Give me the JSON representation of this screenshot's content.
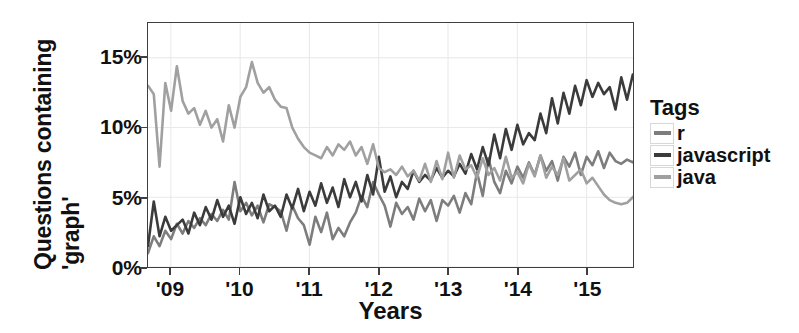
{
  "chart_data": {
    "type": "line",
    "title": "",
    "xlabel": "Years",
    "ylabel": "Questions containing 'graph'",
    "ylabel_lines": [
      "Questions containing",
      "'graph'"
    ],
    "xlim": [
      2008.67,
      2015.67
    ],
    "ylim": [
      0,
      17.5
    ],
    "yticks": [
      0,
      5,
      10,
      15
    ],
    "ytick_labels": [
      "0%",
      "5%",
      "10%",
      "15%"
    ],
    "xticks": [
      2009,
      2010,
      2011,
      2012,
      2013,
      2014,
      2015
    ],
    "xtick_labels": [
      "'09",
      "'10",
      "'11",
      "'12",
      "'13",
      "'14",
      "'15"
    ],
    "grid": true,
    "legend_position": "right",
    "legend_title": "Tags",
    "units": "percent",
    "x_start": 2008.67,
    "x_step": 0.0833,
    "series": [
      {
        "name": "r",
        "color": "#7d7d7d",
        "values": [
          1.0,
          2.2,
          1.5,
          2.6,
          2.0,
          3.1,
          2.4,
          3.3,
          2.8,
          3.5,
          3.0,
          3.8,
          3.3,
          4.1,
          3.4,
          6.1,
          4.0,
          4.6,
          3.7,
          4.4,
          3.2,
          4.5,
          4.3,
          4.0,
          2.6,
          4.4,
          3.5,
          3.0,
          1.6,
          3.6,
          2.5,
          3.9,
          2.0,
          2.8,
          2.2,
          3.2,
          3.9,
          5.1,
          4.3,
          6.1,
          5.2,
          4.4,
          2.9,
          4.6,
          3.8,
          4.3,
          3.4,
          4.9,
          4.0,
          4.8,
          3.3,
          4.8,
          4.4,
          5.1,
          3.9,
          5.3,
          4.5,
          6.8,
          5.1,
          7.8,
          6.1,
          5.3,
          6.9,
          6.0,
          7.2,
          6.4,
          7.5,
          6.6,
          8.0,
          6.9,
          7.6,
          6.2,
          7.9,
          7.2,
          8.2,
          6.6,
          7.9,
          7.3,
          8.3,
          7.1,
          8.2,
          7.6,
          7.4,
          7.7,
          7.5,
          8.0,
          7.8,
          7.6,
          8.1,
          8.6,
          7.9,
          9.0,
          8.2,
          9.4,
          8.6,
          9.7
        ]
      },
      {
        "name": "javascript",
        "color": "#3b3b3b",
        "values": [
          1.5,
          4.7,
          2.2,
          3.6,
          2.6,
          3.0,
          3.4,
          2.4,
          3.9,
          3.0,
          4.3,
          3.4,
          4.8,
          3.6,
          4.4,
          3.1,
          5.0,
          3.8,
          4.6,
          3.5,
          5.2,
          4.0,
          4.4,
          3.6,
          5.2,
          4.2,
          5.6,
          4.0,
          5.4,
          4.4,
          6.0,
          4.6,
          5.7,
          4.3,
          6.3,
          5.0,
          6.1,
          4.7,
          6.6,
          5.2,
          7.9,
          5.4,
          6.5,
          5.0,
          6.1,
          5.6,
          6.9,
          6.1,
          6.6,
          6.2,
          7.1,
          6.4,
          6.9,
          6.5,
          7.4,
          6.7,
          8.1,
          7.0,
          8.6,
          7.3,
          9.5,
          7.8,
          9.9,
          8.4,
          10.2,
          8.8,
          9.6,
          9.1,
          11.0,
          9.6,
          12.1,
          10.3,
          12.5,
          11.0,
          13.0,
          11.6,
          13.4,
          12.2,
          13.2,
          12.4,
          12.9,
          11.3,
          13.6,
          12.0,
          13.8,
          12.4,
          13.4,
          12.1,
          13.5,
          12.6,
          13.1,
          12.2,
          13.7,
          12.8,
          14.0,
          15.0
        ]
      },
      {
        "name": "java",
        "color": "#a0a0a0",
        "values": [
          13.0,
          12.4,
          7.2,
          13.2,
          11.2,
          14.4,
          11.9,
          11.0,
          11.4,
          10.2,
          11.2,
          10.0,
          10.6,
          9.0,
          11.6,
          10.0,
          12.2,
          12.9,
          14.7,
          13.2,
          12.5,
          12.9,
          12.0,
          11.5,
          11.4,
          10.0,
          9.2,
          8.6,
          8.2,
          8.0,
          7.8,
          8.6,
          8.0,
          8.8,
          8.4,
          9.0,
          8.0,
          8.6,
          7.4,
          8.8,
          7.1,
          6.8,
          7.0,
          6.6,
          7.2,
          6.5,
          6.9,
          6.2,
          7.4,
          6.1,
          7.6,
          6.3,
          8.2,
          6.4,
          8.0,
          7.0,
          7.3,
          6.4,
          7.8,
          6.6,
          7.1,
          6.2,
          7.9,
          6.4,
          6.8,
          6.0,
          7.4,
          6.5,
          8.0,
          6.4,
          7.2,
          6.6,
          7.8,
          6.2,
          6.6,
          7.0,
          6.0,
          6.4,
          5.8,
          5.2,
          4.8,
          4.6,
          4.5,
          4.6,
          5.0,
          5.4,
          6.2,
          5.6,
          5.0,
          5.2,
          5.9,
          5.4,
          6.2,
          5.8,
          4.6,
          6.0
        ]
      }
    ]
  },
  "legend": {
    "title": "Tags",
    "items": [
      {
        "label": "r",
        "color": "#7d7d7d"
      },
      {
        "label": "javascript",
        "color": "#3b3b3b"
      },
      {
        "label": "java",
        "color": "#a0a0a0"
      }
    ]
  },
  "axes": {
    "x_title": "Years",
    "y_title_line1": "Questions containing",
    "y_title_line2": "'graph'"
  },
  "colors": {
    "axis": "#3f3f3f",
    "grid": "#e8e8e8",
    "text": "#111111",
    "background": "#ffffff"
  }
}
